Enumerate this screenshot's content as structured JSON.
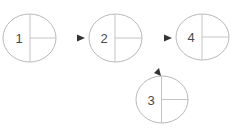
{
  "diagram": {
    "type": "flow",
    "nodes": [
      {
        "id": "n1",
        "label": "1"
      },
      {
        "id": "n2",
        "label": "2"
      },
      {
        "id": "n4",
        "label": "4"
      },
      {
        "id": "n3",
        "label": "3"
      }
    ],
    "edges": [
      {
        "from": "n1",
        "to": "n2"
      },
      {
        "from": "n2",
        "to": "n4"
      },
      {
        "from": null,
        "to": "n3"
      }
    ],
    "colors": {
      "outline": "#b9b9b9",
      "divider": "#c4c4c4",
      "label": "#4a4a4a",
      "arrow": "#333333"
    }
  }
}
